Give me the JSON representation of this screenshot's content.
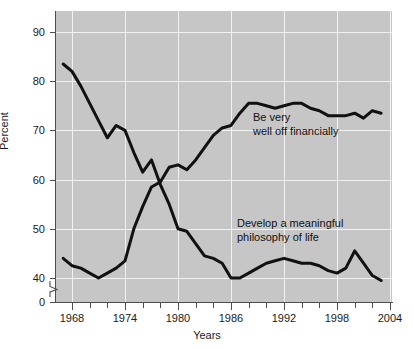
{
  "axes": {
    "y_title": "Percent",
    "x_title": "Years",
    "y_ticks": [
      "90",
      "80",
      "70",
      "60",
      "50",
      "40",
      "0"
    ],
    "x_ticks": [
      "1968",
      "1974",
      "1980",
      "1986",
      "1992",
      "1998",
      "2004"
    ]
  },
  "annotations": {
    "financial": "Be very\nwell off financially",
    "philosophy": "Develop a meaningful\nphilosophy of life"
  },
  "colors": {
    "plot_background": "#c6c6c6",
    "gridline": "#f2f2f2",
    "axis": "#4d4d4d",
    "series": "#111111",
    "page_background": "#ffffff"
  },
  "chart_data": {
    "type": "line",
    "title": "",
    "xlabel": "Years",
    "ylabel": "Percent",
    "xlim": [
      1966.2,
      2004.5
    ],
    "ylim": [
      0,
      93
    ],
    "y_axis_break": true,
    "y_axis_break_note": "axis broken between 0 and 40",
    "y_ticks": [
      40,
      50,
      60,
      70,
      80,
      90
    ],
    "x_ticks_major": [
      1968,
      1974,
      1980,
      1986,
      1992,
      1998,
      2004
    ],
    "x_tick_interval_minor": 2,
    "grid": true,
    "legend": "inline annotations",
    "series": [
      {
        "name": "Develop a meaningful philosophy of life",
        "label_position": "inside-lower-right",
        "x": [
          1967,
          1968,
          1969,
          1970,
          1971,
          1972,
          1973,
          1974,
          1975,
          1976,
          1977,
          1978,
          1979,
          1980,
          1981,
          1982,
          1983,
          1984,
          1985,
          1986,
          1987,
          1988,
          1989,
          1990,
          1991,
          1992,
          1993,
          1994,
          1995,
          1996,
          1997,
          1998,
          1999,
          2000,
          2001,
          2002,
          2003
        ],
        "values": [
          83.5,
          82.0,
          79.0,
          75.5,
          72.0,
          68.5,
          71.0,
          70.0,
          65.5,
          61.5,
          64.0,
          59.0,
          55.0,
          50.0,
          49.5,
          47.0,
          44.5,
          44.0,
          43.0,
          40.0,
          40.0,
          41.0,
          42.0,
          43.0,
          43.5,
          44.0,
          43.5,
          43.0,
          43.0,
          42.5,
          41.5,
          41.0,
          42.0,
          45.5,
          43.0,
          40.5,
          39.5
        ]
      },
      {
        "name": "Be very well off financially",
        "label_position": "inside-upper-right",
        "x": [
          1967,
          1968,
          1969,
          1970,
          1971,
          1972,
          1973,
          1974,
          1975,
          1976,
          1977,
          1978,
          1979,
          1980,
          1981,
          1982,
          1983,
          1984,
          1985,
          1986,
          1987,
          1988,
          1989,
          1990,
          1991,
          1992,
          1993,
          1994,
          1995,
          1996,
          1997,
          1998,
          1999,
          2000,
          2001,
          2002,
          2003
        ],
        "values": [
          44.0,
          42.5,
          42.0,
          41.0,
          40.0,
          41.0,
          42.0,
          43.5,
          50.0,
          54.5,
          58.5,
          59.5,
          62.5,
          63.0,
          62.0,
          64.0,
          66.5,
          69.0,
          70.5,
          71.0,
          73.5,
          75.5,
          75.5,
          75.0,
          74.5,
          75.0,
          75.5,
          75.5,
          74.5,
          74.0,
          73.0,
          73.0,
          73.0,
          73.5,
          72.5,
          74.0,
          73.5
        ]
      }
    ]
  }
}
